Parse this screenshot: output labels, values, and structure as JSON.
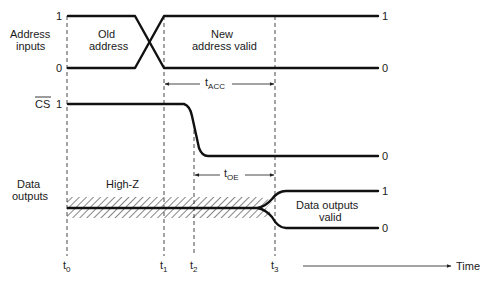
{
  "diagram": {
    "signals": {
      "address": {
        "label_line1": "Address",
        "label_line2": "inputs",
        "level_high": "1",
        "level_low": "0",
        "region_old_line1": "Old",
        "region_old_line2": "address",
        "region_new_line1": "New",
        "region_new_line2": "address valid",
        "end_high": "1",
        "end_low": "0"
      },
      "cs": {
        "label": "CS",
        "level_high": "1",
        "end_low": "0"
      },
      "data": {
        "label_line1": "Data",
        "label_line2": "outputs",
        "region_highz": "High-Z",
        "region_valid_line1": "Data outputs",
        "region_valid_line2": "valid",
        "end_high": "1",
        "end_low": "0"
      }
    },
    "intervals": {
      "t_acc": {
        "base": "t",
        "sub": "ACC"
      },
      "t_oe": {
        "base": "t",
        "sub": "OE"
      }
    },
    "time_markers": [
      {
        "base": "t",
        "sub": "0"
      },
      {
        "base": "t",
        "sub": "1"
      },
      {
        "base": "t",
        "sub": "2"
      },
      {
        "base": "t",
        "sub": "3"
      }
    ],
    "time_axis_label": "Time"
  }
}
